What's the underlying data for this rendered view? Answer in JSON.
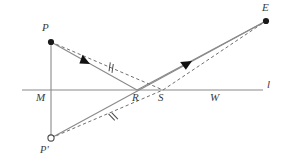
{
  "figure": {
    "type": "geometry-diagram",
    "canvas": {
      "width": 285,
      "height": 166
    },
    "colors": {
      "background": "#ffffff",
      "line": "#8a8a8a",
      "dashed": "#7a7a7a",
      "point_fill": "#1a1a1a",
      "point_hollow_fill": "#ffffff",
      "label": "#3a3a3a",
      "arrow": "#111111"
    },
    "points": [
      {
        "id": "P",
        "label": "P",
        "x": 51,
        "y": 42,
        "style": "filled",
        "label_x": 42,
        "label_y": 24
      },
      {
        "id": "E",
        "label": "E",
        "x": 266,
        "y": 21,
        "style": "filled",
        "label_x": 263,
        "label_y": 4
      },
      {
        "id": "Pp",
        "label": "P'",
        "x": 51,
        "y": 138,
        "style": "hollow",
        "label_x": 42,
        "label_y": 146
      },
      {
        "id": "M",
        "label": "M",
        "x": 51,
        "y": 90,
        "style": "none",
        "label_x": 37,
        "label_y": 93
      },
      {
        "id": "R",
        "label": "R",
        "x": 137,
        "y": 90,
        "style": "none",
        "label_x": 133,
        "label_y": 93
      },
      {
        "id": "S",
        "label": "S",
        "x": 163,
        "y": 90,
        "style": "none",
        "label_x": 159,
        "label_y": 93
      },
      {
        "id": "W",
        "label": "W",
        "x": 216,
        "y": 90,
        "style": "none",
        "label_x": 211,
        "label_y": 93
      },
      {
        "id": "l",
        "label": "l",
        "x": 268,
        "y": 90,
        "style": "none",
        "label_x": 267,
        "label_y": 80
      }
    ],
    "segments": [
      {
        "id": "line-l",
        "name": "horizontal-line-l",
        "kind": "solid",
        "x1": 22,
        "y1": 90,
        "x2": 263,
        "y2": 90
      },
      {
        "id": "PM",
        "name": "vertical-P-to-Pprime",
        "kind": "solid",
        "x1": 51,
        "y1": 42,
        "x2": 51,
        "y2": 138
      },
      {
        "id": "PR",
        "name": "segment-P-to-R",
        "kind": "solid",
        "x1": 51,
        "y1": 42,
        "x2": 137,
        "y2": 90
      },
      {
        "id": "RE",
        "name": "segment-R-to-E",
        "kind": "solid",
        "x1": 137,
        "y1": 90,
        "x2": 266,
        "y2": 21
      },
      {
        "id": "PpE",
        "name": "segment-Pprime-to-E",
        "kind": "solid",
        "x1": 51,
        "y1": 138,
        "x2": 266,
        "y2": 21
      },
      {
        "id": "PS",
        "name": "dashed-P-to-S",
        "kind": "dashed",
        "x1": 51,
        "y1": 42,
        "x2": 163,
        "y2": 90
      },
      {
        "id": "SE",
        "name": "dashed-S-to-E",
        "kind": "dashed",
        "x1": 163,
        "y1": 90,
        "x2": 266,
        "y2": 21
      },
      {
        "id": "PpS",
        "name": "dashed-Pprime-to-S",
        "kind": "dashed",
        "x1": 51,
        "y1": 138,
        "x2": 163,
        "y2": 90
      }
    ],
    "arrows": [
      {
        "id": "arrow-PR",
        "name": "arrowhead-on-P-to-R",
        "x": 90,
        "y": 64,
        "angle_deg": 29
      },
      {
        "id": "arrow-RE",
        "name": "arrowhead-on-R-to-E",
        "x": 192,
        "y": 61,
        "angle_deg": -28
      }
    ],
    "tick_marks": [
      {
        "id": "tick-upper",
        "name": "congruence-tick-upper",
        "x": 110,
        "y": 67,
        "angle_deg": 29,
        "count": 2
      },
      {
        "id": "tick-lower",
        "name": "congruence-tick-lower",
        "x": 112,
        "y": 117,
        "angle_deg": -23,
        "count": 2
      }
    ]
  }
}
